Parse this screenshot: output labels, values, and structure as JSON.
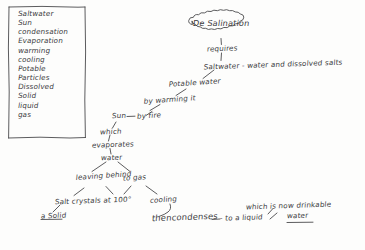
{
  "page": {
    "medium": "handwritten pencil concept map on white paper",
    "ink_color": "#3b3b3d",
    "paper_color": "#fdfdfc"
  },
  "vocabulary_box": {
    "name": "key words list",
    "items": [
      "Saltwater",
      "Sun",
      "condensation",
      "Evaporation",
      "warming",
      "cooling",
      "Potable",
      "Particles",
      "Dissolved",
      "Solid",
      "liquid",
      "gas"
    ]
  },
  "title": {
    "text": "De Salination"
  },
  "map": {
    "requires": "requires",
    "saltwater_def": "Saltwater - water and dissolved salts",
    "potable_water": "Potable water",
    "by_warming": "by warming it",
    "sun": "Sun",
    "by_fire": "by fire",
    "which": "which",
    "evaporates": "evaporates",
    "water": "water",
    "leaving_behind": "leaving behind",
    "to_gas": "to gas",
    "salt_crystals": "Salt crystals at 100°",
    "a_solid": "a Solid",
    "cooling": "cooling",
    "then_condenses": "thencondenses",
    "to_a_liquid": "- to a liquid",
    "which_is_now": "which is now drinkable",
    "drinkable_water": "water"
  }
}
